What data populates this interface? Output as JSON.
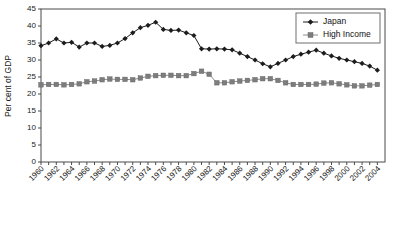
{
  "chart_data": {
    "type": "line",
    "title": "",
    "xlabel": "",
    "ylabel": "Per cent of GDP",
    "ylim": [
      0,
      45
    ],
    "ytick_step": 5,
    "yticks": [
      0,
      5,
      10,
      15,
      20,
      25,
      30,
      35,
      40,
      45
    ],
    "ytick_labels": [
      "0",
      "5",
      "10",
      "15",
      "20",
      "25",
      "30",
      "35",
      "40",
      "45"
    ],
    "xlim": [
      1960,
      2005
    ],
    "x_all": [
      1960,
      1961,
      1962,
      1963,
      1964,
      1965,
      1966,
      1967,
      1968,
      1969,
      1970,
      1971,
      1972,
      1973,
      1974,
      1975,
      1976,
      1977,
      1978,
      1979,
      1980,
      1981,
      1982,
      1983,
      1984,
      1985,
      1986,
      1987,
      1988,
      1989,
      1990,
      1991,
      1992,
      1993,
      1994,
      1995,
      1996,
      1997,
      1998,
      1999,
      2000,
      2001,
      2002,
      2003,
      2004
    ],
    "xtick_labels": [
      "1960",
      "1962",
      "1964",
      "1966",
      "1968",
      "1970",
      "1972",
      "1974",
      "1976",
      "1978",
      "1980",
      "1982",
      "1984",
      "1986",
      "1988",
      "1990",
      "1992",
      "1994",
      "1996",
      "1998",
      "2000",
      "2002",
      "2004"
    ],
    "xtick_values": [
      1960,
      1962,
      1964,
      1966,
      1968,
      1970,
      1972,
      1974,
      1976,
      1978,
      1980,
      1982,
      1984,
      1986,
      1988,
      1990,
      1992,
      1994,
      1996,
      1998,
      2000,
      2002,
      2004
    ],
    "xtick_rotation": 45,
    "grid": false,
    "legend_position": "top-right",
    "series": [
      {
        "name": "Japan",
        "marker": "diamond",
        "color": "#1c1c1c",
        "values": [
          34.2,
          35.0,
          36.2,
          35.0,
          35.2,
          33.8,
          35.0,
          35.0,
          34.0,
          34.3,
          35.0,
          36.3,
          38.0,
          39.5,
          40.2,
          41.1,
          39.0,
          38.7,
          38.8,
          38.0,
          37.2,
          33.3,
          33.2,
          33.3,
          33.2,
          33.0,
          32.0,
          31.0,
          30.0,
          28.9,
          28.0,
          29.0,
          30.0,
          31.0,
          31.7,
          32.3,
          32.9,
          32.0,
          31.2,
          30.5,
          30.0,
          29.5,
          29.0,
          28.2,
          27.0,
          26.3,
          25.6,
          25.0,
          24.2,
          24.0,
          24.8
        ]
      },
      {
        "name": "High Income",
        "marker": "square",
        "color": "#7d7d7d",
        "values": [
          22.7,
          22.8,
          22.8,
          22.7,
          22.8,
          23.0,
          23.6,
          23.8,
          24.2,
          24.4,
          24.3,
          24.3,
          24.2,
          24.7,
          25.2,
          25.4,
          25.5,
          25.5,
          25.4,
          25.4,
          26.0,
          26.7,
          25.8,
          23.3,
          23.3,
          23.6,
          23.8,
          24.0,
          24.2,
          24.5,
          24.5,
          24.0,
          23.3,
          22.8,
          22.8,
          22.8,
          22.9,
          23.2,
          23.3,
          23.0,
          22.7,
          22.4,
          22.4,
          22.6,
          22.8,
          22.9,
          22.5,
          21.6,
          20.8,
          20.0,
          20.7
        ]
      }
    ]
  },
  "legend": {
    "entries": [
      {
        "label": "Japan"
      },
      {
        "label": "High Income"
      }
    ]
  },
  "axes": {
    "y_title": "Per cent of GDP"
  }
}
